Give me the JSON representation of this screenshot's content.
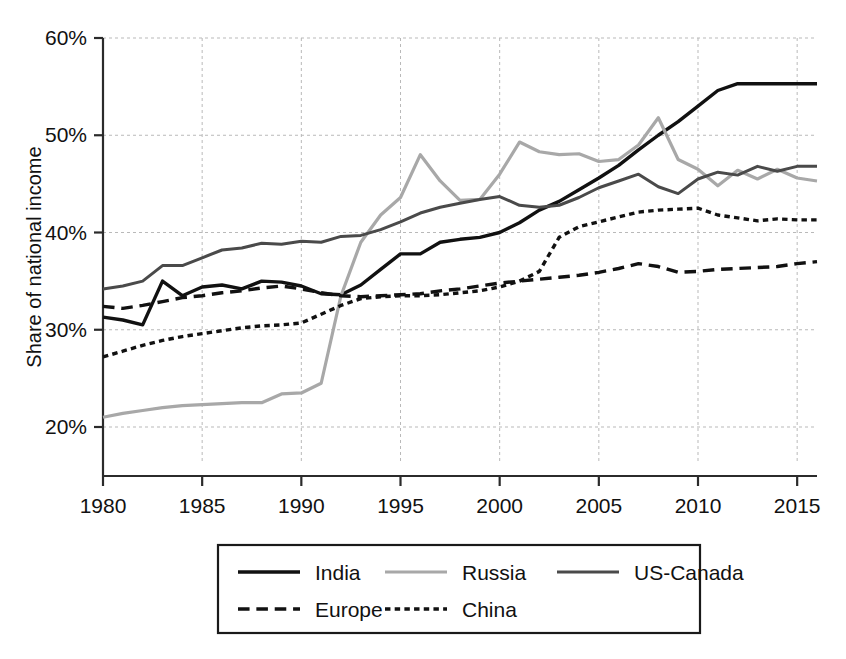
{
  "chart_data": {
    "type": "line",
    "title": "",
    "subtitle": "",
    "xlabel": "",
    "ylabel": "Share of national income",
    "xlim": [
      1980,
      2016
    ],
    "ylim": [
      16,
      61
    ],
    "grid": true,
    "legend_position": "bottom",
    "y_tick_labels": [
      "20%",
      "30%",
      "40%",
      "50%",
      "60%"
    ],
    "y_tick_values": [
      20,
      30,
      40,
      50,
      60
    ],
    "x_tick_labels": [
      "1980",
      "1985",
      "1990",
      "1995",
      "2000",
      "2005",
      "2010",
      "2015"
    ],
    "x_tick_values": [
      1980,
      1985,
      1990,
      1995,
      2000,
      2005,
      2010,
      2015
    ],
    "x": [
      1980,
      1981,
      1982,
      1983,
      1984,
      1985,
      1986,
      1987,
      1988,
      1989,
      1990,
      1991,
      1992,
      1993,
      1994,
      1995,
      1996,
      1997,
      1998,
      1999,
      2000,
      2001,
      2002,
      2003,
      2004,
      2005,
      2006,
      2007,
      2008,
      2009,
      2010,
      2011,
      2012,
      2013,
      2014,
      2015,
      2016
    ],
    "series": [
      {
        "name": "India",
        "style": "solid",
        "color": "#111111",
        "width": 3.4,
        "values": [
          31.3,
          31.0,
          30.5,
          35.0,
          33.5,
          34.4,
          34.6,
          34.2,
          35.0,
          34.9,
          34.5,
          33.7,
          33.6,
          34.6,
          36.2,
          37.8,
          37.8,
          39.0,
          39.3,
          39.5,
          40.0,
          41.0,
          42.3,
          43.2,
          44.4,
          45.6,
          46.9,
          48.5,
          50.0,
          51.4,
          53.0,
          54.6,
          55.3,
          55.3,
          55.3,
          55.3,
          55.3
        ]
      },
      {
        "name": "Russia",
        "style": "solid",
        "color": "#a8a8a8",
        "width": 3.2,
        "values": [
          21.0,
          21.4,
          21.7,
          22.0,
          22.2,
          22.3,
          22.4,
          22.5,
          22.5,
          23.4,
          23.5,
          24.5,
          33.5,
          39.0,
          41.8,
          43.6,
          48.0,
          45.3,
          43.3,
          43.4,
          46.0,
          49.3,
          48.3,
          48.0,
          48.1,
          47.3,
          47.5,
          49.0,
          51.8,
          47.5,
          46.5,
          44.8,
          46.4,
          45.5,
          46.5,
          45.6,
          45.3
        ]
      },
      {
        "name": "US-Canada",
        "style": "solid",
        "color": "#4a4a4a",
        "width": 3.0,
        "values": [
          34.2,
          34.5,
          35.0,
          36.6,
          36.6,
          37.4,
          38.2,
          38.4,
          38.9,
          38.8,
          39.1,
          39.0,
          39.6,
          39.7,
          40.3,
          41.1,
          42.0,
          42.6,
          43.0,
          43.4,
          43.7,
          42.8,
          42.6,
          42.8,
          43.6,
          44.6,
          45.3,
          46.0,
          44.7,
          44.0,
          45.5,
          46.2,
          45.9,
          46.8,
          46.3,
          46.8,
          46.8
        ]
      },
      {
        "name": "Europe",
        "style": "dashed-long",
        "color": "#111111",
        "width": 3.4,
        "values": [
          32.4,
          32.2,
          32.5,
          32.9,
          33.3,
          33.5,
          33.8,
          34.0,
          34.3,
          34.5,
          34.2,
          33.8,
          33.5,
          33.4,
          33.5,
          33.6,
          33.7,
          34.0,
          34.2,
          34.5,
          34.8,
          35.0,
          35.2,
          35.4,
          35.6,
          35.9,
          36.3,
          36.8,
          36.5,
          35.9,
          36.0,
          36.2,
          36.3,
          36.4,
          36.5,
          36.8,
          37.0
        ]
      },
      {
        "name": "China",
        "style": "dashed-short",
        "color": "#111111",
        "width": 3.4,
        "values": [
          27.2,
          27.8,
          28.4,
          28.9,
          29.3,
          29.6,
          29.9,
          30.2,
          30.4,
          30.5,
          30.7,
          31.6,
          32.5,
          33.2,
          33.4,
          33.5,
          33.5,
          33.6,
          33.8,
          34.0,
          34.4,
          35.0,
          36.0,
          39.5,
          40.6,
          41.1,
          41.6,
          42.1,
          42.3,
          42.4,
          42.5,
          41.8,
          41.5,
          41.2,
          41.4,
          41.3,
          41.3
        ]
      }
    ],
    "legend": [
      {
        "label": "India",
        "style": "solid",
        "color": "#111111"
      },
      {
        "label": "Russia",
        "style": "solid",
        "color": "#a8a8a8"
      },
      {
        "label": "US-Canada",
        "style": "solid",
        "color": "#4a4a4a"
      },
      {
        "label": "Europe",
        "style": "dashed-long",
        "color": "#111111"
      },
      {
        "label": "China",
        "style": "dashed-short",
        "color": "#111111"
      }
    ]
  }
}
